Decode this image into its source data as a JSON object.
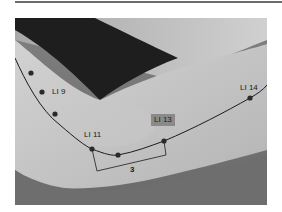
{
  "figure": {
    "labels": {
      "li9": "LI 9",
      "li11": "LI 11",
      "li13": "LI 13",
      "li14": "LI 14",
      "measure": "3"
    },
    "points": [
      {
        "x": 31,
        "y": 73
      },
      {
        "x": 42,
        "y": 92
      },
      {
        "x": 55,
        "y": 114
      },
      {
        "x": 92,
        "y": 149
      },
      {
        "x": 118,
        "y": 155
      },
      {
        "x": 164,
        "y": 141
      },
      {
        "x": 250,
        "y": 98
      }
    ],
    "colors": {
      "line": "#1c1c1c",
      "point": "#2a2a2a",
      "highlight_box": "#8a8a8a"
    }
  }
}
